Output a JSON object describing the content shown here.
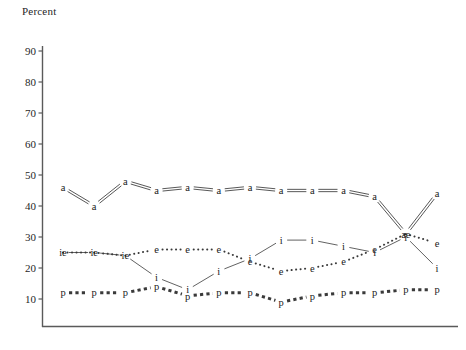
{
  "chart_data": {
    "type": "line",
    "title": "",
    "ylabel": "Percent",
    "xlabel": "",
    "ylim": [
      5,
      93
    ],
    "yticks": [
      90,
      80,
      70,
      60,
      50,
      40,
      30,
      20,
      10
    ],
    "grid": false,
    "legend": "none",
    "xticks": [],
    "x": [
      1,
      2,
      3,
      4,
      5,
      6,
      7,
      8,
      9,
      10,
      11,
      12,
      13
    ],
    "series": [
      {
        "name": "a",
        "marker": "a",
        "style": "double-line",
        "values": [
          46,
          40,
          48,
          45,
          46,
          45,
          46,
          45,
          45,
          45,
          43,
          31,
          44
        ]
      },
      {
        "name": "e",
        "marker": "e",
        "style": "dotted",
        "values": [
          25,
          25,
          24,
          26,
          26,
          26,
          22,
          19,
          20,
          22,
          26,
          31,
          28
        ]
      },
      {
        "name": "i",
        "marker": "i",
        "style": "thin-solid",
        "values": [
          25,
          25,
          24,
          17,
          13,
          19,
          23,
          29,
          29,
          27,
          25,
          30,
          20
        ]
      },
      {
        "name": "p",
        "marker": "p",
        "style": "thick-dashed",
        "values": [
          12,
          12,
          12,
          14,
          11,
          12,
          12,
          9,
          11,
          12,
          12,
          13,
          13
        ]
      }
    ],
    "combined_labels": [
      {
        "x": 1,
        "text": "ie",
        "series": [
          "i",
          "e"
        ]
      },
      {
        "x": 2,
        "text": "ie",
        "series": [
          "i",
          "e"
        ]
      },
      {
        "x": 3,
        "text": "ie",
        "series": [
          "i",
          "e"
        ]
      },
      {
        "x": 12,
        "text": "ae",
        "series": [
          "a",
          "e"
        ]
      }
    ],
    "colors": {
      "axis": "#5a5a5a",
      "line": "#3a3a3a",
      "text": "#1a1a1a"
    }
  },
  "axis": {
    "ylabel": "Percent",
    "tick_90": "90",
    "tick_80": "80",
    "tick_70": "70",
    "tick_60": "60",
    "tick_50": "50",
    "tick_40": "40",
    "tick_30": "30",
    "tick_20": "20",
    "tick_10": "10"
  }
}
